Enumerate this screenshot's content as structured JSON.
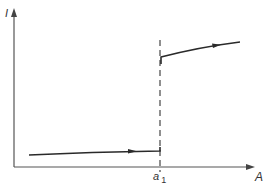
{
  "figure": {
    "y_axis_label": "I",
    "x_axis_label": "A",
    "threshold_label_main": "a",
    "threshold_label_sub": "1",
    "colors": {
      "ink": "#2a2a2a",
      "axis": "#444444",
      "background": "#ffffff"
    }
  },
  "curves": [
    {
      "name": "lower-branch",
      "description": "Low I below threshold a1, nearly flat, arrow pointing right"
    },
    {
      "name": "upper-branch",
      "description": "High I above threshold a1, rising slowly, arrow pointing right"
    }
  ]
}
